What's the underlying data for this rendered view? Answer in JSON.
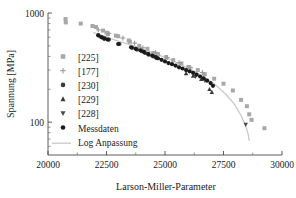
{
  "chart_data": {
    "type": "scatter",
    "title": "",
    "xlabel": "Larson-Miller-Parameter",
    "ylabel": "Spannung [MPa]",
    "xlim": [
      20000,
      30000
    ],
    "ylim": [
      50,
      1000
    ],
    "yscale": "log",
    "xscale": "linear",
    "grid": false,
    "xticks": [
      20000,
      22500,
      25000,
      27500,
      30000
    ],
    "xticklabels": [
      "20000",
      "22500",
      "25000",
      "27500",
      "30000"
    ],
    "yticks": [
      100,
      1000
    ],
    "yticklabels": [
      "100",
      "1000"
    ],
    "legend_position": "center-left",
    "series": [
      {
        "name": "[225]",
        "marker": "square",
        "color": "#a8a8a8",
        "points": [
          [
            20750,
            880
          ],
          [
            20760,
            820
          ],
          [
            21400,
            800
          ],
          [
            21900,
            760
          ],
          [
            22050,
            745
          ],
          [
            22350,
            690
          ],
          [
            22500,
            660
          ],
          [
            22560,
            640
          ],
          [
            22900,
            620
          ],
          [
            23000,
            612
          ],
          [
            23450,
            560
          ],
          [
            23500,
            545
          ],
          [
            23900,
            500
          ],
          [
            24250,
            470
          ],
          [
            24500,
            430
          ],
          [
            24700,
            420
          ],
          [
            25050,
            395
          ],
          [
            25350,
            370
          ],
          [
            25700,
            345
          ],
          [
            26000,
            320
          ],
          [
            26400,
            300
          ],
          [
            26700,
            275
          ],
          [
            27100,
            250
          ],
          [
            27500,
            225
          ],
          [
            27900,
            195
          ],
          [
            28250,
            160
          ],
          [
            28500,
            140
          ],
          [
            28600,
            118
          ],
          [
            28700,
            105
          ],
          [
            29250,
            88
          ]
        ]
      },
      {
        "name": "[177]",
        "marker": "plus",
        "color": "#9a9a9a",
        "points": [
          [
            22150,
            700
          ],
          [
            22600,
            650
          ],
          [
            23200,
            590
          ],
          [
            23700,
            530
          ],
          [
            24050,
            480
          ],
          [
            24600,
            435
          ],
          [
            25100,
            390
          ],
          [
            25600,
            350
          ],
          [
            26100,
            315
          ],
          [
            26600,
            285
          ]
        ]
      },
      {
        "name": "[230]",
        "marker": "circle",
        "color": "#3a3a3a",
        "points": [
          [
            22150,
            625
          ],
          [
            22280,
            600
          ],
          [
            22400,
            580
          ],
          [
            22600,
            570
          ],
          [
            23050,
            520
          ],
          [
            23600,
            480
          ],
          [
            23800,
            462
          ],
          [
            24000,
            448
          ],
          [
            24150,
            430
          ],
          [
            24300,
            415
          ],
          [
            24500,
            400
          ],
          [
            24650,
            385
          ]
        ]
      },
      {
        "name": "[229]",
        "marker": "triangle-up",
        "color": "#3a3a3a",
        "points": [
          [
            25900,
            280
          ],
          [
            26200,
            265
          ],
          [
            26550,
            248
          ],
          [
            26900,
            200
          ],
          [
            27000,
            188
          ]
        ]
      },
      {
        "name": "[228]",
        "marker": "triangle-down",
        "color": "#4a4a4a",
        "points": [
          [
            26300,
            262
          ],
          [
            26700,
            240
          ],
          [
            28450,
            95
          ]
        ]
      },
      {
        "name": "Messdaten",
        "marker": "circle",
        "color": "#1a1a1a",
        "points": [
          [
            22150,
            625
          ],
          [
            22300,
            598
          ],
          [
            22420,
            585
          ],
          [
            22550,
            572
          ],
          [
            23000,
            520
          ],
          [
            23550,
            485
          ],
          [
            23750,
            470
          ],
          [
            23950,
            455
          ],
          [
            24100,
            440
          ],
          [
            24280,
            422
          ],
          [
            24450,
            408
          ],
          [
            24600,
            395
          ],
          [
            24700,
            385
          ],
          [
            24850,
            372
          ],
          [
            25000,
            360
          ],
          [
            25150,
            348
          ],
          [
            25300,
            340
          ],
          [
            25450,
            330
          ],
          [
            25600,
            318
          ],
          [
            25750,
            310
          ],
          [
            25900,
            300
          ],
          [
            26050,
            292
          ],
          [
            26200,
            283
          ],
          [
            26350,
            272
          ],
          [
            26500,
            262
          ],
          [
            26650,
            252
          ],
          [
            26800,
            240
          ],
          [
            26950,
            228
          ],
          [
            27050,
            215
          ]
        ]
      }
    ],
    "fit": {
      "name": "Log Anpassung",
      "color": "#c8c8c8",
      "points": [
        [
          21950,
          660
        ],
        [
          22500,
          600
        ],
        [
          23000,
          553
        ],
        [
          23500,
          512
        ],
        [
          24000,
          472
        ],
        [
          24500,
          432
        ],
        [
          25000,
          392
        ],
        [
          25500,
          352
        ],
        [
          26000,
          312
        ],
        [
          26400,
          280
        ],
        [
          26800,
          248
        ],
        [
          27200,
          215
        ],
        [
          27600,
          180
        ],
        [
          27950,
          148
        ],
        [
          28250,
          115
        ],
        [
          28450,
          92
        ],
        [
          28550,
          78
        ],
        [
          28600,
          68
        ]
      ]
    }
  },
  "legend": {
    "entries": [
      {
        "label": "[225]",
        "marker": "square"
      },
      {
        "label": "[177]",
        "marker": "plus"
      },
      {
        "label": "[230]",
        "marker": "circle"
      },
      {
        "label": "[229]",
        "marker": "triangle-up"
      },
      {
        "label": "[228]",
        "marker": "triangle-down"
      },
      {
        "label": "Messdaten",
        "marker": "circle"
      },
      {
        "label": "Log Anpassung",
        "marker": "line"
      }
    ]
  },
  "axes": {
    "x_title": "Larson-Miller-Parameter",
    "y_title": "Spannung [MPa]",
    "x_tick_0": "20000",
    "x_tick_1": "22500",
    "x_tick_2": "25000",
    "x_tick_3": "27500",
    "x_tick_4": "30000",
    "y_tick_0": "100",
    "y_tick_1": "1000"
  },
  "colors": {
    "axis": "#4a4a4a",
    "text": "#1a1a1a",
    "fit_line": "#c8c8c8",
    "light_marker": "#a8a8a8",
    "dark_marker": "#1a1a1a"
  }
}
